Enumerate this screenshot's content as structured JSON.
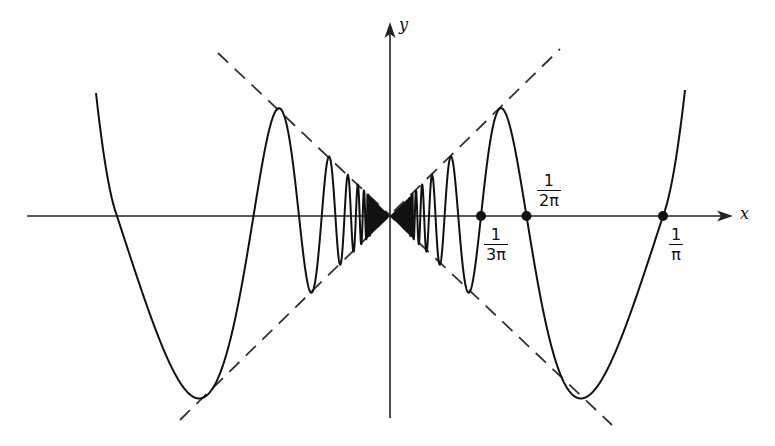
{
  "figure": {
    "function": "y = x sin(1/x)",
    "envelope": [
      "y = x",
      "y = -x"
    ],
    "axes": {
      "x_label": "x",
      "y_label": "y"
    },
    "marked_points": [
      {
        "id": "one-over-3pi",
        "numerator": "1",
        "denominator": "3π",
        "value": 0.1061
      },
      {
        "id": "one-over-2pi",
        "numerator": "1",
        "denominator": "2π",
        "value": 0.1592
      },
      {
        "id": "one-over-pi",
        "numerator": "1",
        "denominator": "π",
        "value": 0.3183
      }
    ],
    "colors": {
      "curve": "#111111",
      "axes": "#222222",
      "envelope": "#333333",
      "background": "#fefefe"
    }
  },
  "geometry": {
    "origin_px": [
      390,
      216
    ],
    "px_per_unit_x": 857.7,
    "px_per_unit_y": 840.0,
    "x_axis_px": [
      27,
      733
    ],
    "y_axis_px": [
      418,
      22
    ]
  }
}
